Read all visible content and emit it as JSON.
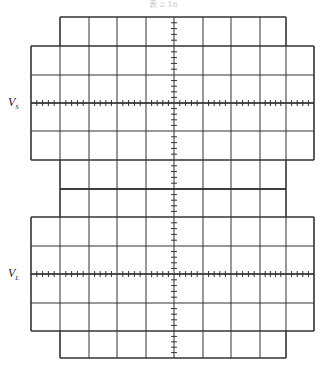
{
  "header": {
    "text": "表 2.16"
  },
  "screen": {
    "labels": [
      {
        "id": "vs",
        "main": "V",
        "sub": "S",
        "row_y": 103
      },
      {
        "id": "vl",
        "main": "V",
        "sub": "L",
        "row_y": 274
      }
    ],
    "grid": {
      "columns_x": [
        31,
        60,
        89,
        117,
        146,
        174,
        203,
        231,
        260,
        286,
        314
      ],
      "top_section_rows_y": [
        17,
        46,
        75,
        103,
        131,
        160,
        189
      ],
      "bottom_section_rows_y": [
        189,
        217,
        246,
        274,
        303,
        331,
        358
      ],
      "center_axis_x": 174,
      "subdivisions_per_division": 5
    },
    "colors": {
      "line": "#333333",
      "background": "#ffffff"
    }
  }
}
